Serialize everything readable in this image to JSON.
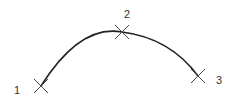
{
  "diagram": {
    "type": "three-point-arc",
    "colors": {
      "arc": "#222222",
      "marker": "#444444",
      "label": "#333333",
      "background": "#ffffff"
    },
    "points": [
      {
        "label": "1",
        "x": 41,
        "y": 86,
        "label_x": 14,
        "label_y": 85
      },
      {
        "label": "2",
        "x": 122,
        "y": 32,
        "label_x": 124,
        "label_y": 9
      },
      {
        "label": "3",
        "x": 198,
        "y": 76,
        "label_x": 216,
        "label_y": 75
      }
    ]
  }
}
